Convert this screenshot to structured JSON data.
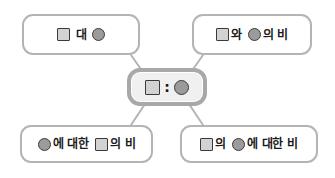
{
  "diagram": {
    "type": "ratio-expression-map",
    "title": "",
    "center": {
      "id": "center",
      "name": "ratio-notation",
      "tokens": [
        {
          "kind": "square"
        },
        {
          "kind": "colon",
          "text": ":"
        },
        {
          "kind": "circle"
        }
      ],
      "plain_text": "□ : ○"
    },
    "nodes": [
      {
        "id": "top-left",
        "name": "expression-square-dae-circle",
        "tokens": [
          {
            "kind": "square"
          },
          {
            "kind": "text",
            "text": "대"
          },
          {
            "kind": "circle"
          }
        ],
        "plain_text": "□ 대 ○"
      },
      {
        "id": "top-right",
        "name": "expression-square-wa-circle-ui-bi",
        "tokens": [
          {
            "kind": "square"
          },
          {
            "kind": "text",
            "text": "와"
          },
          {
            "kind": "circle"
          },
          {
            "kind": "text",
            "text": "의 비"
          }
        ],
        "plain_text": "□와 ○의 비"
      },
      {
        "id": "bottom-left",
        "name": "expression-circle-e-daehan-square-ui-bi",
        "tokens": [
          {
            "kind": "circle"
          },
          {
            "kind": "text",
            "text": "에 대한"
          },
          {
            "kind": "square"
          },
          {
            "kind": "text",
            "text": "의 비"
          }
        ],
        "plain_text": "○에 대한 □의 비"
      },
      {
        "id": "bottom-right",
        "name": "expression-square-ui-circle-e-daehan-bi",
        "tokens": [
          {
            "kind": "square"
          },
          {
            "kind": "text",
            "text": "의"
          },
          {
            "kind": "circle"
          },
          {
            "kind": "text",
            "text": "에 대한 비"
          }
        ],
        "plain_text": "□의 ○에 대한 비"
      }
    ],
    "symbols": {
      "square_label": "square-symbol",
      "circle_label": "circle-symbol",
      "colon_label": "colon-symbol"
    },
    "colors": {
      "square_fill": "#d2d2d2",
      "circle_fill": "#9b9b9b",
      "symbol_outline": "#3a3a3a",
      "node_border": "#b4b4b4",
      "center_border": "#a8a8a8",
      "center_fill": "#f0f0f0",
      "connector": "#b4b4b4",
      "text": "#1a1a1a",
      "background": "#ffffff"
    }
  }
}
